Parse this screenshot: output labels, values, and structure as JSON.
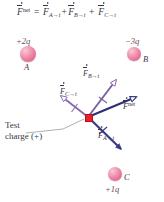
{
  "figure": {
    "background": "#ffffff"
  },
  "equation": {
    "lhs_symbol": "F",
    "lhs_superscript": "net",
    "equals": "=",
    "plus": "+",
    "terms": [
      {
        "symbol": "F",
        "subscript": "A→t"
      },
      {
        "symbol": "F",
        "subscript": "B→t"
      },
      {
        "symbol": "F",
        "subscript": "C→t"
      }
    ],
    "full_text": "F⃗net = F⃗A→t + F⃗B→t + F⃗C→t"
  },
  "charges": [
    {
      "id": "A",
      "name": "A",
      "magnitude_label": "+2q",
      "label_position": "below",
      "magnitude_position": "above",
      "color": "#e8799a"
    },
    {
      "id": "B",
      "name": "B",
      "magnitude_label": "−3q",
      "label_position": "right",
      "magnitude_position": "above",
      "color": "#e8799a"
    },
    {
      "id": "C",
      "name": "C",
      "magnitude_label": "+1q",
      "label_position": "right",
      "magnitude_position": "below",
      "color": "#e8799a"
    }
  ],
  "test_charge": {
    "line1": "Test",
    "line2": "charge (+)",
    "marker_color": "#e8202a",
    "sign": "+"
  },
  "vectors": [
    {
      "id": "F_A_to_t",
      "symbol": "F",
      "subscript": "A→t",
      "color": "#3a3a8c",
      "style": "solid-filled-head",
      "direction": "down-right",
      "tick_marks": 1
    },
    {
      "id": "F_B_to_t",
      "symbol": "F",
      "subscript": "B→t",
      "color": "#7a5f9e",
      "style": "hollow-head",
      "direction": "up-right",
      "tick_marks": 1
    },
    {
      "id": "F_C_to_t",
      "symbol": "F",
      "subscript": "C→t",
      "color": "#8a6aae",
      "style": "hollow-head",
      "direction": "up-left",
      "tick_marks": 1
    },
    {
      "id": "F_net",
      "symbol": "F",
      "superscript": "net",
      "color": "#2f2f78",
      "style": "hollow-head",
      "direction": "right",
      "tick_marks": 0
    }
  ],
  "colors": {
    "vector_blue": "#3a3a8c",
    "vector_purple": "#8a6aae",
    "net_blue": "#2f2f78",
    "charge_pink": "#e8799a",
    "test_red": "#e8202a",
    "text": "#35353f",
    "leader_line": "#9a9aa2"
  }
}
